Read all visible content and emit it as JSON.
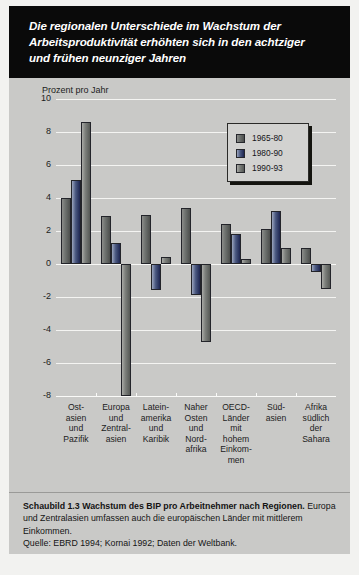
{
  "header": {
    "title": "Die regionalen Unterschiede im Wachstum der\nArbeitsproduktivität erhöhten sich in den achtziger\nund frühen neunziger Jahren"
  },
  "caption": {
    "bold_lead": "Schaubild 1.3   Wachstum des BIP pro Arbeitnehmer nach Regionen.",
    "body": " Europa und Zentralasien umfassen auch die europäischen Länder mit mittlerem Einkommen.",
    "source": "Quelle: EBRD 1994; Kornai 1992; Daten der Weltbank."
  },
  "colors": {
    "series_1965_80": "#6f7370",
    "series_1980_90": "#2c3663",
    "series_1990_93": "#858884",
    "panel_background": "#c9c9c7",
    "banner_background": "#0a0a0a",
    "gridline": "#f4f4f2"
  },
  "chart_data": {
    "type": "bar",
    "title": "Die regionalen Unterschiede im Wachstum der Arbeitsproduktivität erhöhten sich in den achtziger und frühen neunziger Jahren",
    "ylabel": "Prozent pro Jahr",
    "xlabel": "",
    "ylim": [
      -8,
      10
    ],
    "yticks": [
      10,
      8,
      6,
      4,
      2,
      0,
      -2,
      -4,
      -6,
      -8
    ],
    "ytick_labels": [
      "10",
      "8",
      "6",
      "4",
      "2",
      "0",
      "-2",
      "-4",
      "-6",
      "-8"
    ],
    "grid": true,
    "legend_position": "top-right",
    "categories": [
      "Ost-\nasien\nund\nPazifik",
      "Europa\nund\nZentral-\nasien",
      "Latein-\namerika\nund\nKaribik",
      "Naher\nOsten\nund\nNord-\nafrika",
      "OECD-\nLänder\nmit\nhohem\nEinkom-\nmen",
      "Süd-\nasien",
      "Afrika\nsüdlich\nder\nSahara"
    ],
    "series": [
      {
        "name": "1965-80",
        "values": [
          4.0,
          2.9,
          3.0,
          3.4,
          2.4,
          2.1,
          1.0
        ]
      },
      {
        "name": "1980-90",
        "values": [
          5.1,
          1.3,
          -1.6,
          -1.9,
          1.8,
          3.2,
          -0.5
        ]
      },
      {
        "name": "1990-93",
        "values": [
          8.6,
          -8.0,
          0.4,
          -4.7,
          0.3,
          1.0,
          -1.5
        ]
      }
    ]
  }
}
